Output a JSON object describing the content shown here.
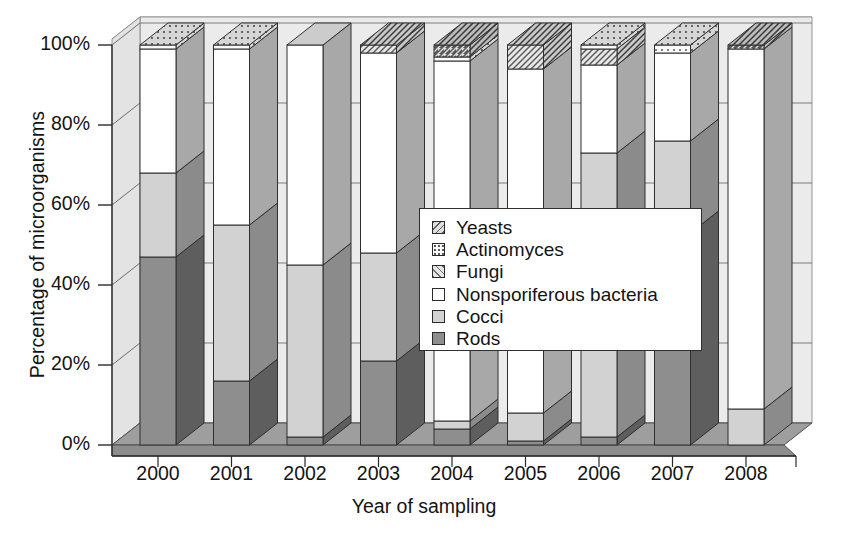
{
  "chart_data": {
    "type": "bar",
    "subtype": "stacked-percentage-3d",
    "title": "",
    "xlabel": "Year of sampling",
    "ylabel": "Percentage of microorganisms",
    "categories": [
      "2000",
      "2001",
      "2002",
      "2003",
      "2004",
      "2005",
      "2006",
      "2007",
      "2008"
    ],
    "ylim": [
      0,
      100
    ],
    "yticks": [
      "0%",
      "20%",
      "40%",
      "60%",
      "80%",
      "100%"
    ],
    "ytick_values": [
      0,
      20,
      40,
      60,
      80,
      100
    ],
    "grid": true,
    "legend_position": "center",
    "stack_order_bottom_to_top": [
      "Rods",
      "Cocci",
      "Nonsporiferous bacteria",
      "Fungi",
      "Actinomyces",
      "Yeasts"
    ],
    "series": [
      {
        "name": "Rods",
        "values": [
          47,
          16,
          2,
          21,
          4,
          1,
          2,
          53,
          0
        ]
      },
      {
        "name": "Cocci",
        "values": [
          21,
          39,
          43,
          27,
          2,
          7,
          71,
          23,
          9
        ]
      },
      {
        "name": "Nonsporiferous bacteria",
        "values": [
          31,
          44,
          55,
          50,
          90,
          86,
          22,
          22,
          90
        ]
      },
      {
        "name": "Fungi",
        "values": [
          0,
          0,
          0,
          2,
          0,
          6,
          4,
          0,
          0
        ]
      },
      {
        "name": "Actinomyces",
        "values": [
          1,
          1,
          0,
          0,
          1,
          0,
          1,
          2,
          0
        ]
      },
      {
        "name": "Yeasts",
        "values": [
          0,
          0,
          0,
          0,
          3,
          0,
          0,
          0,
          1
        ]
      }
    ]
  },
  "axes": {
    "ylabel": "Percentage of microorganisms",
    "xlabel": "Year of sampling",
    "yticks": [
      "100%",
      "80%",
      "60%",
      "40%",
      "20%",
      "0%"
    ],
    "xticks": [
      "2000",
      "2001",
      "2002",
      "2003",
      "2004",
      "2005",
      "2006",
      "2007",
      "2008"
    ]
  },
  "legend": {
    "items": [
      {
        "label": "Yeasts",
        "pattern": "yeasts",
        "swatch_name": "legend-swatch-yeasts"
      },
      {
        "label": "Actinomyces",
        "pattern": "actino",
        "swatch_name": "legend-swatch-actinomyces"
      },
      {
        "label": "Fungi",
        "pattern": "fungi",
        "swatch_name": "legend-swatch-fungi"
      },
      {
        "label": "Nonsporiferous bacteria",
        "pattern": "nonspor",
        "swatch_name": "legend-swatch-nonsporiferous-bacteria"
      },
      {
        "label": "Cocci",
        "pattern": "cocci",
        "swatch_name": "legend-swatch-cocci"
      },
      {
        "label": "Rods",
        "pattern": "rods",
        "swatch_name": "legend-swatch-rods"
      }
    ]
  },
  "colors": {
    "rods": "#8e8e8e",
    "cocci": "#d2d2d2",
    "nonsporiferous": "#ffffff",
    "fungi": "#e6e6e6",
    "actinomyces": "#fbfbfb",
    "yeasts": "#dedede",
    "backwall": "#ebebeb",
    "floor": "#9a9a9a",
    "axis": "#2b2b2b",
    "text": "#141414"
  }
}
